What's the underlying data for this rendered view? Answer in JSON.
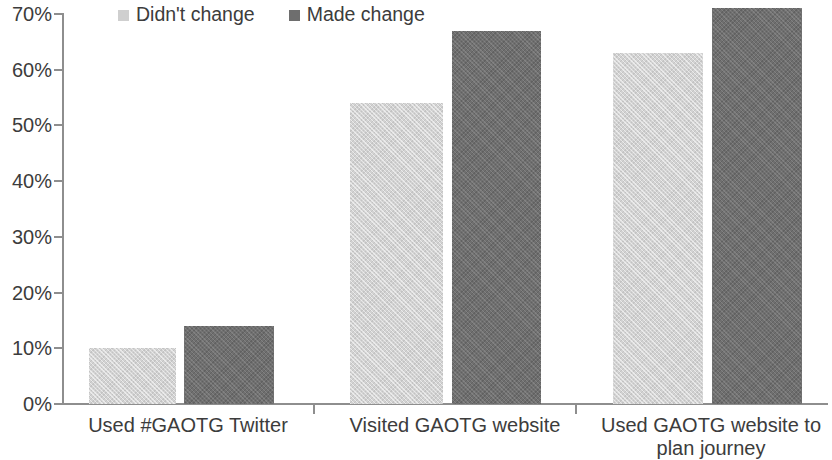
{
  "chart_data": {
    "type": "bar",
    "title": "",
    "xlabel": "",
    "ylabel": "",
    "ylim": [
      0,
      70
    ],
    "grid": false,
    "legend_position": "top-left",
    "y_ticks": [
      "0%",
      "10%",
      "20%",
      "30%",
      "40%",
      "50%",
      "60%",
      "70%"
    ],
    "y_tick_values": [
      0,
      10,
      20,
      30,
      40,
      50,
      60,
      70
    ],
    "categories": [
      "Used #GAOTG Twitter",
      "Visited GAOTG website",
      "Used GAOTG website to plan journey"
    ],
    "series": [
      {
        "name": "Didn't change",
        "color": "#d2d2d2",
        "values": [
          10,
          54,
          63
        ]
      },
      {
        "name": "Made change",
        "color": "#6f6f6f",
        "values": [
          14,
          67,
          71
        ]
      }
    ]
  },
  "legend": {
    "items": [
      {
        "label": "Didn't change",
        "swatch": "light"
      },
      {
        "label": "Made change",
        "swatch": "dark"
      }
    ]
  },
  "axis": {
    "line_color": "#8e8e8e",
    "text_color": "#3c3c3c"
  }
}
